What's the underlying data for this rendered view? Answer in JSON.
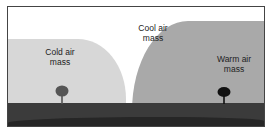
{
  "diagram": {
    "labels": {
      "cold": [
        "Cold air",
        "mass"
      ],
      "cool": [
        "Cool air",
        "mass"
      ],
      "warm": [
        "Warm air",
        "mass"
      ]
    },
    "colors": {
      "cold_air": "#d7d7d7",
      "warm_air": "#a9a9a9",
      "ground": "#3b3b3b",
      "tree_cold": "#555555",
      "tree_warm": "#111111"
    },
    "icons": [
      "tree-icon",
      "tree-icon"
    ]
  }
}
